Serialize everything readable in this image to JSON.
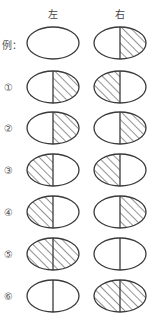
{
  "headers": {
    "left": "左",
    "right": "右"
  },
  "colors": {
    "stroke": "#3a3a3a",
    "hatch": "#3a3a3a",
    "background": "#ffffff"
  },
  "rows": [
    {
      "label": "例：",
      "left": "none",
      "right": "right"
    },
    {
      "label": "①",
      "left": "right",
      "right": "left"
    },
    {
      "label": "②",
      "left": "right",
      "right": "right"
    },
    {
      "label": "③",
      "left": "left",
      "right": "left"
    },
    {
      "label": "④",
      "left": "left",
      "right": "right"
    },
    {
      "label": "⑤",
      "left": "both",
      "right": "none"
    },
    {
      "label": "⑥",
      "left": "none",
      "right": "both"
    }
  ]
}
